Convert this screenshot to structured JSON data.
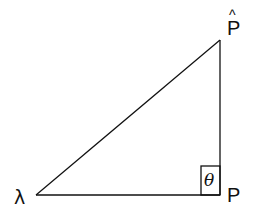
{
  "diagram": {
    "type": "right-triangle",
    "vertices": {
      "left": {
        "label": "λ"
      },
      "bottom_right": {
        "label": "P"
      },
      "top_right": {
        "label": "P",
        "accent": "^"
      }
    },
    "angle_marker": {
      "label": "θ"
    },
    "colors": {
      "stroke": "#111111",
      "background": "#ffffff"
    }
  }
}
